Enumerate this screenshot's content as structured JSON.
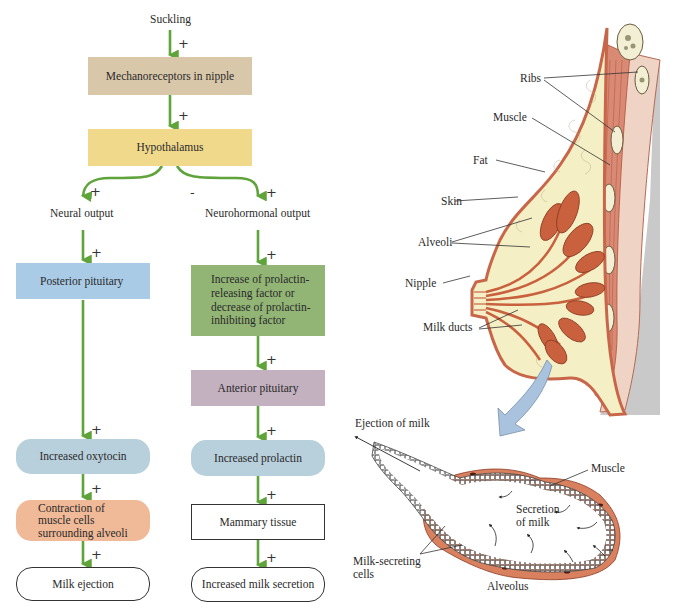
{
  "flowchart": {
    "start": "Suckling",
    "nodes": {
      "mechanoreceptors": {
        "label": "Mechanoreceptors in nipple",
        "color": "#d9c7a9"
      },
      "hypothalamus": {
        "label": "Hypothalamus",
        "color": "#f1d98c"
      },
      "neural_output": {
        "label": "Neural output"
      },
      "neurohormonal_output": {
        "label": "Neurohormonal output"
      },
      "posterior_pituitary": {
        "label": "Posterior pituitary",
        "color": "#a9cbe6"
      },
      "prolactin_factor": {
        "label": "Increase of prolactin-releasing factor or decrease of prolactin-inhibiting factor",
        "lines": [
          "Increase of prolactin-",
          "releasing factor or",
          "decrease of prolactin-",
          "inhibiting factor"
        ],
        "color": "#92b576"
      },
      "anterior_pituitary": {
        "label": "Anterior pituitary",
        "color": "#c3b1c0"
      },
      "increased_oxytocin": {
        "label": "Increased oxytocin",
        "color": "#b8cfdc"
      },
      "increased_prolactin": {
        "label": "Increased prolactin",
        "color": "#b8cfdc"
      },
      "contraction": {
        "label": "Contraction of muscle cells surrounding alveoli",
        "lines": [
          "Contraction of",
          "muscle cells",
          "surrounding alveoli"
        ],
        "color": "#f0b997"
      },
      "mammary_tissue": {
        "label": "Mammary tissue",
        "color": "#ffffff"
      },
      "milk_ejection": {
        "label": "Milk ejection",
        "color": "#ffffff"
      },
      "milk_secretion": {
        "label": "Increased milk secretion",
        "color": "#ffffff"
      }
    },
    "signs": {
      "plus": "+",
      "minus": "-"
    },
    "arrow_color": "#5fa33b"
  },
  "anatomy": {
    "breast_labels": {
      "ribs": "Ribs",
      "muscle": "Muscle",
      "fat": "Fat",
      "skin": "Skin",
      "alveoli": "Alveoli",
      "nipple": "Nipple",
      "milk_ducts": "Milk ducts"
    },
    "alveolus_labels": {
      "ejection": "Ejection of milk",
      "muscle": "Muscle",
      "secretion_line1": "Secretion",
      "secretion_line2": "of milk",
      "cells_line1": "Milk-secreting",
      "cells_line2": "cells",
      "alveolus": "Alveolus"
    },
    "colors": {
      "skin": "#c8664a",
      "fat": "#f4efc4",
      "alveoli": "#c9603e",
      "muscle": "#d98a74",
      "chest_wall": "#efd3c4",
      "shadow": "#c9c9c9",
      "zoom_arrow": "#a9c3de"
    }
  }
}
